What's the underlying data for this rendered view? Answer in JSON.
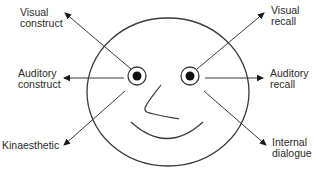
{
  "diagram": {
    "face": {
      "outline": {
        "cx": 168,
        "cy": 92,
        "rx": 81,
        "ry": 74
      },
      "left_eye": {
        "cx": 137,
        "cy": 76,
        "r_outer": 9,
        "r_pupil": 4.5
      },
      "right_eye": {
        "cx": 190,
        "cy": 76,
        "r_outer": 9,
        "r_pupil": 4.5
      },
      "stroke_color": "#3a3a3a",
      "pupil_color": "#111111"
    },
    "labels": {
      "visual_construct": {
        "line1": "Visual",
        "line2": "construct"
      },
      "visual_recall": {
        "line1": "Visual",
        "line2": "recall"
      },
      "auditory_construct": {
        "line1": "Auditory",
        "line2": "construct"
      },
      "auditory_recall": {
        "line1": "Auditory",
        "line2": "recall"
      },
      "kinaesthetic": {
        "line1": "Kinaesthetic"
      },
      "internal_dialogue": {
        "line1": "Internal",
        "line2": "dialogue"
      }
    },
    "arrows": [
      {
        "name": "visual-construct-arrow",
        "from": [
          131,
          69
        ],
        "to": [
          65,
          13
        ]
      },
      {
        "name": "visual-recall-arrow",
        "from": [
          197,
          69
        ],
        "to": [
          264,
          13
        ]
      },
      {
        "name": "auditory-construct-arrow",
        "from": [
          124,
          78
        ],
        "to": [
          64,
          78
        ]
      },
      {
        "name": "auditory-recall-arrow",
        "from": [
          205,
          78
        ],
        "to": [
          263,
          78
        ]
      },
      {
        "name": "kinaesthetic-arrow",
        "from": [
          125,
          91
        ],
        "to": [
          64,
          145
        ]
      },
      {
        "name": "internal-dialogue-arrow",
        "from": [
          204,
          91
        ],
        "to": [
          266,
          145
        ]
      }
    ]
  }
}
